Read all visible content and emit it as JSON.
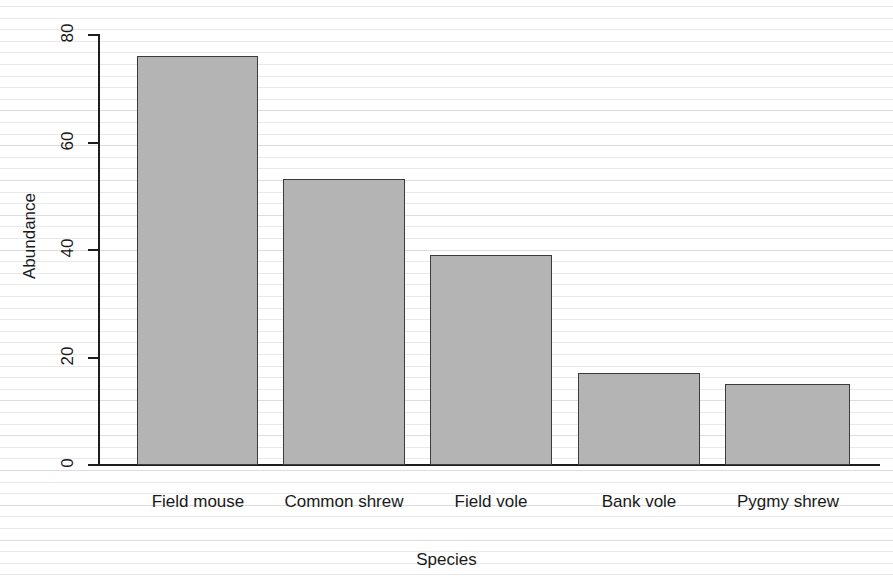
{
  "chart_data": {
    "type": "bar",
    "title": "",
    "categories": [
      "Field mouse",
      "Common shrew",
      "Field vole",
      "Bank vole",
      "Pygmy shrew"
    ],
    "values": [
      76,
      53,
      39,
      17,
      15
    ],
    "xlabel": "Species",
    "ylabel": "Abundance",
    "ylim": [
      0,
      80
    ],
    "yticks": [
      0,
      20,
      40,
      60,
      80
    ],
    "ytick_labels": [
      "0",
      "20",
      "40",
      "60",
      "80"
    ],
    "grid": false,
    "legend": null,
    "bar_fill_color": "#b4b4b4",
    "bar_border_color": "#3b3b3b",
    "axis_color": "#1d1d1d",
    "background_color": "#ffffff"
  },
  "axes": {
    "y_title": "Abundance",
    "x_title": "Species"
  },
  "bars": [
    {
      "label": "Field mouse",
      "value": 76,
      "left": 37,
      "width": 121
    },
    {
      "label": "Common shrew",
      "value": 53,
      "left": 183,
      "width": 122
    },
    {
      "label": "Field vole",
      "value": 39,
      "left": 330,
      "width": 122
    },
    {
      "label": "Bank vole",
      "value": 17,
      "left": 478,
      "width": 122
    },
    {
      "label": "Pygmy shrew",
      "value": 15,
      "left": 625,
      "width": 125
    }
  ],
  "ytick_positions": [
    {
      "label": "80",
      "top": 34
    },
    {
      "label": "60",
      "top": 142
    },
    {
      "label": "40",
      "top": 249
    },
    {
      "label": "20",
      "top": 357
    },
    {
      "label": "0",
      "top": 464
    }
  ],
  "xtick_positions": [
    {
      "label": "Field mouse",
      "center": 198
    },
    {
      "label": "Common shrew",
      "center": 344
    },
    {
      "label": "Field vole",
      "center": 491
    },
    {
      "label": "Bank vole",
      "center": 639
    },
    {
      "label": "Pygmy shrew",
      "center": 788
    }
  ]
}
